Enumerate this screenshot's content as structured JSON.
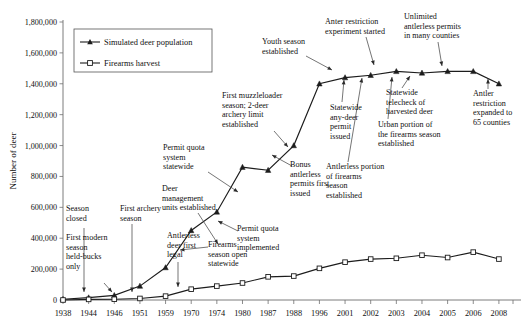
{
  "chart_data": {
    "type": "line",
    "title": "",
    "xlabel": "",
    "ylabel": "Number of deer",
    "ylim": [
      0,
      1800000
    ],
    "ytick_labels": [
      "0",
      "200,000",
      "400,000",
      "600,000",
      "800,000",
      "1,000,000",
      "1,200,000",
      "1,400,000",
      "1,600,000",
      "1,800,000"
    ],
    "ytick_values": [
      0,
      200000,
      400000,
      600000,
      800000,
      1000000,
      1200000,
      1400000,
      1600000,
      1800000
    ],
    "grid": false,
    "legend_position": "top-left",
    "categories": [
      "1938",
      "1944",
      "1946",
      "1951",
      "1959",
      "1970",
      "1974",
      "1980",
      "1987",
      "1988",
      "1996",
      "2001",
      "2002",
      "2003",
      "2004",
      "2005",
      "2006",
      "2008"
    ],
    "series": [
      {
        "name": "Simulated deer population",
        "marker": "filled-triangle",
        "values": [
          5000,
          15000,
          30000,
          90000,
          210000,
          450000,
          570000,
          860000,
          840000,
          1000000,
          1400000,
          1440000,
          1455000,
          1480000,
          1470000,
          1480000,
          1480000,
          1400000
        ]
      },
      {
        "name": "Firearms harvest",
        "marker": "open-square",
        "values": [
          0,
          4000,
          5000,
          10000,
          25000,
          70000,
          90000,
          110000,
          150000,
          155000,
          205000,
          245000,
          265000,
          270000,
          290000,
          275000,
          310000,
          265000
        ]
      }
    ],
    "annotations": [
      {
        "id": "season-closed",
        "text": "Season\nclosed",
        "target_year": "1938"
      },
      {
        "id": "first-modern-season",
        "text": "First modern\nseason\nheld-bucks\nonly",
        "target_year": "1944"
      },
      {
        "id": "first-archery-season",
        "text": "First archery\nseason",
        "target_year": "1946"
      },
      {
        "id": "antlerless-deer-first-legal",
        "text": "Antlerless\ndeer first\nlegal",
        "target_year": "1951"
      },
      {
        "id": "deer-management-units",
        "text": "Deer\nmanagement\nunits established",
        "target_year": "1959"
      },
      {
        "id": "firearms-season-open-statewide",
        "text": "Firearms\nseason open\nstatewide",
        "target_year": "1959"
      },
      {
        "id": "permit-quota-system-statewide",
        "text": "Permit quota\nsystem\nstatewide",
        "target_year": "1974"
      },
      {
        "id": "permit-quota-system-implemented",
        "text": "Permit quota\nsystem\nimplemented",
        "target_year": "1970"
      },
      {
        "id": "first-muzzleloader-season",
        "text": "First muzzleloader\nseason; 2-deer\narchery limit\nestablished",
        "target_year": "1987"
      },
      {
        "id": "bonus-antlerless-permits",
        "text": "Bonus\nantlerless\npermits first\nissued",
        "target_year": "1980"
      },
      {
        "id": "youth-season-established",
        "text": "Youth season\nestablished",
        "target_year": "1996"
      },
      {
        "id": "statewide-any-deer-permit",
        "text": "Statewide\nany-deer\npermit\nissued",
        "target_year": "2001"
      },
      {
        "id": "antlerless-portion-firearms",
        "text": "Antlerless portion\nof firearms\nseason\nestablished",
        "target_year": "2002"
      },
      {
        "id": "antler-restriction-experiment",
        "text": "Anter restriction\nexperiment started",
        "target_year": "2003"
      },
      {
        "id": "urban-portion-firearms",
        "text": "Urban portion of\nthe firearms season\nestablished",
        "target_year": "2003"
      },
      {
        "id": "statewide-telecheck",
        "text": "Statewide\ntelecheck of\nharvested deer",
        "target_year": "2004"
      },
      {
        "id": "unlimited-antlerless-permits",
        "text": "Unlimited\nantlerless permits\nin many counties",
        "target_year": "2005"
      },
      {
        "id": "antler-restriction-expanded",
        "text": "Antler\nrestriction\nexpanded to\n65 counties",
        "target_year": "2008"
      }
    ]
  },
  "legend": {
    "entries": [
      {
        "label": "Simulated deer population"
      },
      {
        "label": "Firearms harvest"
      }
    ]
  },
  "colors": {
    "line": "#1c1c1c",
    "axis": "#6e6e6e",
    "text": "#101010"
  }
}
